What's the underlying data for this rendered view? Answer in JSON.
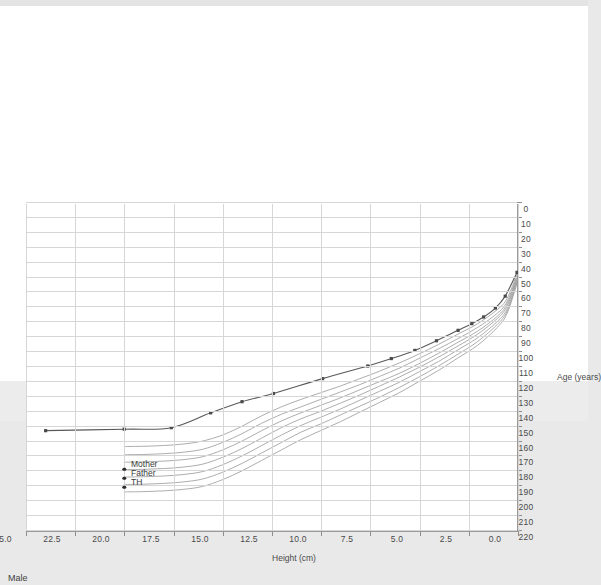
{
  "page": {
    "background": "#e9e9e9",
    "sheet_color": "#ffffff"
  },
  "chart_title": "Male",
  "axes": {
    "y_title": "Height (cm)",
    "x_title": "Age (years)",
    "y_ticks": [
      "0",
      "10",
      "20",
      "30",
      "40",
      "50",
      "60",
      "70",
      "80",
      "90",
      "100",
      "110",
      "120",
      "130",
      "140",
      "150",
      "160",
      "170",
      "180",
      "190",
      "200",
      "210",
      "220"
    ],
    "x_ticks": [
      "0.0",
      "2.5",
      "5.0",
      "7.5",
      "10.0",
      "12.5",
      "15.0",
      "17.5",
      "20.0",
      "22.5",
      "25.0"
    ]
  },
  "annotations": [
    {
      "label": "TH",
      "age": 20.0,
      "height": 190.0
    },
    {
      "label": "Father",
      "age": 20.0,
      "height": 184.0
    },
    {
      "label": "Mother",
      "age": 20.0,
      "height": 178.0
    }
  ],
  "colors": {
    "percentile_curve": "#9e9e9e",
    "patient_curve": "#595959",
    "grid": "#d6d6d6",
    "axis": "#9a9a9a",
    "marker": "#4a4a4a",
    "text": "#4a4a4a"
  },
  "chart_data": {
    "type": "line",
    "title": "Male",
    "xlabel": "Age (years)",
    "ylabel": "Height (cm)",
    "xlim": [
      0,
      25
    ],
    "ylim": [
      0,
      220
    ],
    "grid": true,
    "legend": "none",
    "series": [
      {
        "name": "3rd percentile",
        "kind": "percentile",
        "x": [
          0,
          0.5,
          1,
          2,
          3,
          4,
          5,
          6,
          7,
          8,
          9,
          10,
          11,
          12,
          13,
          14,
          15,
          16,
          17,
          18,
          19,
          20
        ],
        "values": [
          47.0,
          63.5,
          71.0,
          80.5,
          87.5,
          94.5,
          101.0,
          107.0,
          112.5,
          117.5,
          122.5,
          127.0,
          131.5,
          136.5,
          142.5,
          149.5,
          155.5,
          159.5,
          161.5,
          162.5,
          163.0,
          163.2
        ]
      },
      {
        "name": "10th percentile",
        "kind": "percentile",
        "x": [
          0,
          0.5,
          1,
          2,
          3,
          4,
          5,
          6,
          7,
          8,
          9,
          10,
          11,
          12,
          13,
          14,
          15,
          16,
          17,
          18,
          19,
          20
        ],
        "values": [
          48.5,
          65.5,
          73.5,
          83.0,
          90.5,
          97.5,
          104.0,
          110.5,
          116.0,
          121.5,
          126.5,
          131.5,
          136.5,
          141.5,
          147.5,
          154.5,
          160.5,
          165.0,
          167.0,
          168.0,
          168.5,
          168.7
        ]
      },
      {
        "name": "25th percentile",
        "kind": "percentile",
        "x": [
          0,
          0.5,
          1,
          2,
          3,
          4,
          5,
          6,
          7,
          8,
          9,
          10,
          11,
          12,
          13,
          14,
          15,
          16,
          17,
          18,
          19,
          20
        ],
        "values": [
          49.5,
          67.0,
          75.5,
          85.5,
          93.0,
          100.5,
          107.5,
          114.0,
          119.5,
          125.0,
          130.5,
          135.5,
          140.5,
          146.0,
          152.5,
          159.5,
          165.5,
          170.0,
          172.0,
          173.0,
          173.5,
          173.7
        ]
      },
      {
        "name": "50th percentile",
        "kind": "percentile",
        "x": [
          0,
          0.5,
          1,
          2,
          3,
          4,
          5,
          6,
          7,
          8,
          9,
          10,
          11,
          12,
          13,
          14,
          15,
          16,
          17,
          18,
          19,
          20
        ],
        "values": [
          50.5,
          68.5,
          77.0,
          87.5,
          95.5,
          103.0,
          110.0,
          116.5,
          122.5,
          128.5,
          134.0,
          139.5,
          144.5,
          150.5,
          157.5,
          164.5,
          170.5,
          175.0,
          177.0,
          178.0,
          178.5,
          178.7
        ]
      },
      {
        "name": "75th percentile",
        "kind": "percentile",
        "x": [
          0,
          0.5,
          1,
          2,
          3,
          4,
          5,
          6,
          7,
          8,
          9,
          10,
          11,
          12,
          13,
          14,
          15,
          16,
          17,
          18,
          19,
          20
        ],
        "values": [
          51.5,
          70.5,
          79.0,
          90.0,
          98.0,
          106.0,
          113.0,
          120.0,
          126.0,
          132.0,
          138.0,
          143.5,
          149.0,
          155.5,
          162.5,
          169.5,
          175.5,
          180.0,
          182.0,
          183.0,
          183.5,
          183.7
        ]
      },
      {
        "name": "90th percentile",
        "kind": "percentile",
        "x": [
          0,
          0.5,
          1,
          2,
          3,
          4,
          5,
          6,
          7,
          8,
          9,
          10,
          11,
          12,
          13,
          14,
          15,
          16,
          17,
          18,
          19,
          20
        ],
        "values": [
          52.5,
          72.0,
          81.0,
          92.5,
          101.0,
          109.0,
          116.5,
          123.5,
          130.0,
          136.0,
          142.0,
          148.0,
          153.5,
          160.5,
          167.5,
          174.5,
          180.5,
          185.0,
          187.0,
          188.0,
          188.5,
          188.7
        ]
      },
      {
        "name": "97th percentile",
        "kind": "percentile",
        "x": [
          0,
          0.5,
          1,
          2,
          3,
          4,
          5,
          6,
          7,
          8,
          9,
          10,
          11,
          12,
          13,
          14,
          15,
          16,
          17,
          18,
          19,
          20
        ],
        "values": [
          53.5,
          73.5,
          83.0,
          95.0,
          103.5,
          112.0,
          119.5,
          127.0,
          133.5,
          140.0,
          146.5,
          152.5,
          158.5,
          165.5,
          172.5,
          179.5,
          185.5,
          190.0,
          192.0,
          193.0,
          193.5,
          193.7
        ]
      },
      {
        "name": "Patient",
        "kind": "patient",
        "markers": true,
        "x": [
          0.0,
          0.6,
          1.1,
          1.7,
          2.3,
          3.0,
          4.1,
          5.2,
          6.4,
          7.6,
          9.9,
          12.4,
          14.0,
          15.6,
          17.6,
          20.0,
          24.0
        ],
        "values": [
          46.0,
          62.0,
          70.0,
          76.0,
          80.5,
          85.0,
          92.0,
          98.5,
          104.0,
          109.0,
          117.5,
          127.5,
          133.0,
          140.5,
          150.5,
          151.5,
          152.5
        ]
      }
    ]
  }
}
